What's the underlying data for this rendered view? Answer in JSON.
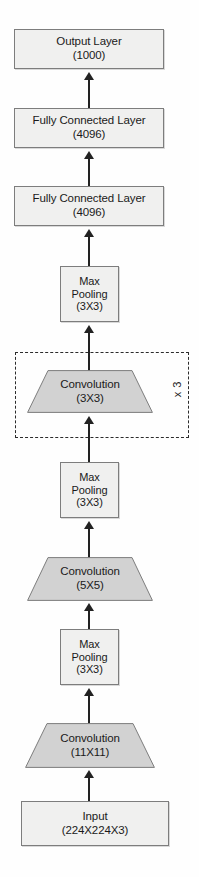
{
  "diagram": {
    "orientation": "bottom-to-top",
    "background_color": "#ffffff",
    "box_fill": "#f0f0ef",
    "trapezoid_fill": "#d2d2d2",
    "stroke_color": "#7d7d7d",
    "arrow_color": "#222222"
  },
  "nodes": [
    {
      "id": "output",
      "shape": "rectangle",
      "line1": "Output Layer",
      "line2": "(1000)"
    },
    {
      "id": "fc2",
      "shape": "rectangle",
      "line1": "Fully Connected Layer",
      "line2": "(4096)"
    },
    {
      "id": "fc1",
      "shape": "rectangle",
      "line1": "Fully Connected Layer",
      "line2": "(4096)"
    },
    {
      "id": "pool3",
      "shape": "rectangle",
      "line1": "Max",
      "line2": "Pooling",
      "line3": "(3X3)"
    },
    {
      "id": "conv3",
      "shape": "trapezoid",
      "line1": "Convolution",
      "line2": "(3X3)"
    },
    {
      "id": "pool2",
      "shape": "rectangle",
      "line1": "Max",
      "line2": "Pooling",
      "line3": "(3X3)"
    },
    {
      "id": "conv2",
      "shape": "trapezoid",
      "line1": "Convolution",
      "line2": "(5X5)"
    },
    {
      "id": "pool1",
      "shape": "rectangle",
      "line1": "Max",
      "line2": "Pooling",
      "line3": "(3X3)"
    },
    {
      "id": "conv1",
      "shape": "trapezoid",
      "line1": "Convolution",
      "line2": "(11X11)"
    },
    {
      "id": "input",
      "shape": "rectangle",
      "line1": "Input",
      "line2": "(224X224X3)"
    }
  ],
  "repeat_group": {
    "label": "x 3",
    "contains": "conv3"
  }
}
